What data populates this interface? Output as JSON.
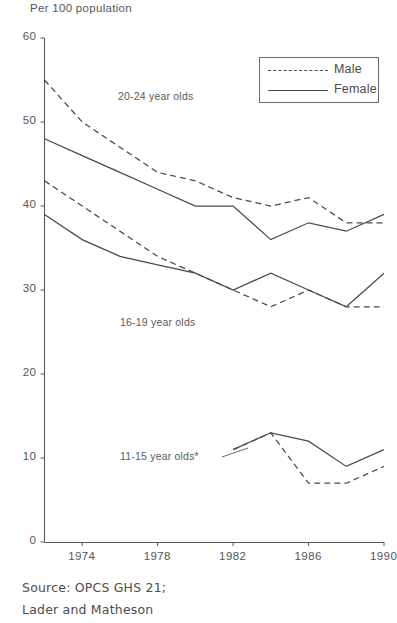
{
  "axis_title": "Per 100 population",
  "legend": {
    "items": [
      {
        "label": "Male",
        "style": "dashed"
      },
      {
        "label": "Female",
        "style": "solid"
      }
    ]
  },
  "annotations": [
    {
      "text": "20-24 year olds"
    },
    {
      "text": "16-19 year olds"
    },
    {
      "text": "11-15 year olds*"
    }
  ],
  "source": {
    "line1": "Source: OPCS GHS 21;",
    "line2": "Lader and Matheson"
  },
  "colors": {
    "line": "#4a4a4a",
    "axis": "#5a5a5a",
    "text": "#55555a",
    "background": "#ffffff"
  },
  "chart_data": {
    "type": "line",
    "title": "",
    "xlabel": "",
    "ylabel": "Per 100 population",
    "ylim": [
      0,
      60
    ],
    "xlim": [
      1972,
      1990
    ],
    "yticks": [
      0,
      10,
      20,
      30,
      40,
      50,
      60
    ],
    "ytick_labels": [
      "0",
      "10",
      "20",
      "30",
      "40",
      "50",
      "60"
    ],
    "xticks": [
      1974,
      1978,
      1982,
      1986,
      1990
    ],
    "xtick_labels": [
      "1974",
      "1978",
      "1982",
      "1986",
      "1990"
    ],
    "grid": false,
    "legend_position": "top-right",
    "footnote": "* 11-15 year olds series begins 1982",
    "series": [
      {
        "name": "20-24 Male",
        "group": "20-24 year olds",
        "sex": "Male",
        "style": "dashed",
        "x": [
          1972,
          1974,
          1976,
          1978,
          1980,
          1982,
          1984,
          1986,
          1988,
          1990
        ],
        "y": [
          55,
          50,
          47,
          44,
          43,
          41,
          40,
          41,
          38,
          38
        ]
      },
      {
        "name": "20-24 Female",
        "group": "20-24 year olds",
        "sex": "Female",
        "style": "solid",
        "x": [
          1972,
          1974,
          1976,
          1978,
          1980,
          1982,
          1984,
          1986,
          1988,
          1990
        ],
        "y": [
          48,
          46,
          44,
          42,
          40,
          40,
          36,
          38,
          37,
          39
        ]
      },
      {
        "name": "16-19 Male",
        "group": "16-19 year olds",
        "sex": "Male",
        "style": "dashed",
        "x": [
          1972,
          1974,
          1976,
          1978,
          1980,
          1982,
          1984,
          1986,
          1988,
          1990
        ],
        "y": [
          43,
          40,
          37,
          34,
          32,
          30,
          28,
          30,
          28,
          28
        ]
      },
      {
        "name": "16-19 Female",
        "group": "16-19 year olds",
        "sex": "Female",
        "style": "solid",
        "x": [
          1972,
          1974,
          1976,
          1978,
          1980,
          1982,
          1984,
          1986,
          1988,
          1990
        ],
        "y": [
          39,
          36,
          34,
          33,
          32,
          30,
          32,
          30,
          28,
          32
        ]
      },
      {
        "name": "11-15 Male",
        "group": "11-15 year olds",
        "sex": "Male",
        "style": "dashed",
        "x": [
          1982,
          1984,
          1986,
          1988,
          1990
        ],
        "y": [
          11,
          13,
          7,
          7,
          9
        ]
      },
      {
        "name": "11-15 Female",
        "group": "11-15 year olds",
        "sex": "Female",
        "style": "solid",
        "x": [
          1982,
          1984,
          1986,
          1988,
          1990
        ],
        "y": [
          11,
          13,
          12,
          9,
          11
        ]
      }
    ]
  }
}
